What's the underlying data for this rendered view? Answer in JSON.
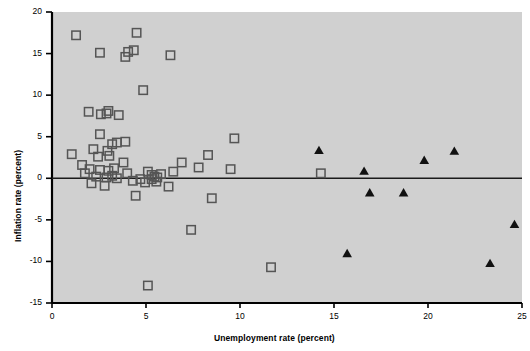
{
  "chart_data": {
    "type": "scatter",
    "title": "",
    "xlabel": "Unemployment rate (percent)",
    "ylabel": "Inflation rate (percent)",
    "xlim": [
      0,
      25
    ],
    "ylim": [
      -15,
      20
    ],
    "xticks": [
      0,
      5,
      10,
      15,
      20,
      25
    ],
    "yticks": [
      20,
      15,
      10,
      5,
      0,
      -5,
      -10,
      -15
    ],
    "xtick_labels": [
      "0",
      "5",
      "10",
      "15",
      "20",
      "25"
    ],
    "ytick_labels": [
      "20",
      "15",
      "10",
      "5",
      "0",
      "-5",
      "-10",
      "-15"
    ],
    "grid": false,
    "legend": "none",
    "plot_background": "#d0d0d0",
    "zero_line_y": 0,
    "series": [
      {
        "name": "open-square",
        "marker": "open-square",
        "color": "#555555",
        "points": [
          [
            1.28,
            17.2
          ],
          [
            2.55,
            15.1
          ],
          [
            3.9,
            14.6
          ],
          [
            4.5,
            17.5
          ],
          [
            4.05,
            15.2
          ],
          [
            4.35,
            15.4
          ],
          [
            6.3,
            14.8
          ],
          [
            1.95,
            8.0
          ],
          [
            2.6,
            7.7
          ],
          [
            2.9,
            7.8
          ],
          [
            3.0,
            8.1
          ],
          [
            3.55,
            7.6
          ],
          [
            4.85,
            10.6
          ],
          [
            2.55,
            5.3
          ],
          [
            3.2,
            4.1
          ],
          [
            3.45,
            4.3
          ],
          [
            3.9,
            4.4
          ],
          [
            1.05,
            2.9
          ],
          [
            1.6,
            1.6
          ],
          [
            2.2,
            3.5
          ],
          [
            2.45,
            2.6
          ],
          [
            2.95,
            3.3
          ],
          [
            3.05,
            2.7
          ],
          [
            2.0,
            1.1
          ],
          [
            2.55,
            1.0
          ],
          [
            3.0,
            0.9
          ],
          [
            3.3,
            1.2
          ],
          [
            2.35,
            0.2
          ],
          [
            2.9,
            0.1
          ],
          [
            3.2,
            0.3
          ],
          [
            3.45,
            0.0
          ],
          [
            1.75,
            0.6
          ],
          [
            2.1,
            -0.6
          ],
          [
            2.8,
            -0.9
          ],
          [
            3.8,
            1.9
          ],
          [
            4.0,
            0.6
          ],
          [
            4.3,
            -0.3
          ],
          [
            4.45,
            -2.1
          ],
          [
            5.1,
            0.8
          ],
          [
            5.3,
            0.4
          ],
          [
            5.45,
            0.2
          ],
          [
            5.6,
            0.1
          ],
          [
            5.3,
            -0.1
          ],
          [
            5.55,
            -0.4
          ],
          [
            5.8,
            0.5
          ],
          [
            4.7,
            -0.1
          ],
          [
            4.95,
            -0.5
          ],
          [
            6.2,
            -1.0
          ],
          [
            6.45,
            0.8
          ],
          [
            6.9,
            1.9
          ],
          [
            7.8,
            1.3
          ],
          [
            8.3,
            2.8
          ],
          [
            9.5,
            1.1
          ],
          [
            9.7,
            4.8
          ],
          [
            8.5,
            -2.4
          ],
          [
            7.4,
            -6.2
          ],
          [
            5.1,
            -12.9
          ],
          [
            11.65,
            -10.7
          ],
          [
            14.3,
            0.6
          ]
        ]
      },
      {
        "name": "filled-triangle",
        "marker": "filled-triangle",
        "color": "#111111",
        "points": [
          [
            14.2,
            3.3
          ],
          [
            16.6,
            0.8
          ],
          [
            16.9,
            -1.8
          ],
          [
            18.7,
            -1.8
          ],
          [
            19.8,
            2.1
          ],
          [
            21.4,
            3.2
          ],
          [
            15.7,
            -9.1
          ],
          [
            23.3,
            -10.3
          ],
          [
            24.6,
            -5.6
          ]
        ]
      }
    ]
  },
  "axes": {
    "plot_left_px": 52,
    "plot_top_px": 12,
    "plot_right_px": 522,
    "plot_bottom_px": 303
  }
}
